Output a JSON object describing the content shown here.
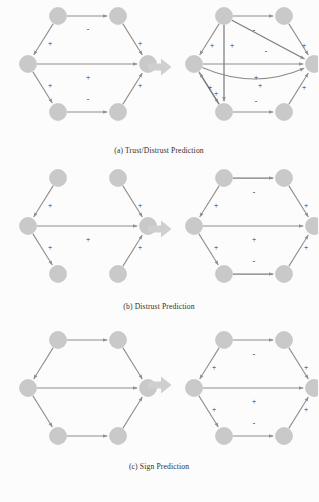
{
  "figure": {
    "background_color": "#fcfcfc",
    "node_color": "#c9c9c9",
    "edge_color": "#8d8d8d",
    "text_color": "#2b2b2b",
    "transition_arrow_color": "#cfcfcf"
  },
  "panels": [
    {
      "id": "a",
      "caption": "(a)  Trust/Distrust Prediction",
      "transition_icon": "right-block-arrow",
      "input_graph": {
        "nodes": [
          {
            "id": "n1",
            "label": "",
            "x": 44,
            "y": 16
          },
          {
            "id": "n2",
            "label": "",
            "x": 104,
            "y": 16
          },
          {
            "id": "n3",
            "label": "",
            "x": 14,
            "y": 64
          },
          {
            "id": "n4",
            "label": "",
            "x": 134,
            "y": 64
          },
          {
            "id": "n5",
            "label": "",
            "x": 44,
            "y": 112
          },
          {
            "id": "n6",
            "label": "",
            "x": 104,
            "y": 112
          }
        ],
        "edges": [
          {
            "from": "n1",
            "to": "n2",
            "sign": "-",
            "sign_x": 74,
            "sign_y": 30
          },
          {
            "from": "n1",
            "to": "n3",
            "sign": "+",
            "sign_x": 36,
            "sign_y": 44
          },
          {
            "from": "n3",
            "to": "n4",
            "sign": "+",
            "sign_x": 74,
            "sign_y": 78
          },
          {
            "from": "n3",
            "to": "n5",
            "sign": "+",
            "sign_x": 36,
            "sign_y": 86
          },
          {
            "from": "n5",
            "to": "n6",
            "sign": "-",
            "sign_x": 74,
            "sign_y": 100
          },
          {
            "from": "n6",
            "to": "n4",
            "sign": "+",
            "sign_x": 126,
            "sign_y": 86
          },
          {
            "from": "n2",
            "to": "n4",
            "sign": "+",
            "sign_x": 126,
            "sign_y": 44
          }
        ]
      },
      "output_graph": {
        "nodes": [
          {
            "id": "n1",
            "label": "",
            "x": 44,
            "y": 16
          },
          {
            "id": "n2",
            "label": "",
            "x": 104,
            "y": 16
          },
          {
            "id": "n3",
            "label": "",
            "x": 14,
            "y": 64
          },
          {
            "id": "n4",
            "label": "",
            "x": 134,
            "y": 64
          },
          {
            "id": "n5",
            "label": "",
            "x": 44,
            "y": 112
          },
          {
            "id": "n6",
            "label": "",
            "x": 104,
            "y": 112
          }
        ],
        "edges": [
          {
            "from": "n1",
            "to": "n2",
            "sign": "-",
            "sign_x": 74,
            "sign_y": 31
          },
          {
            "from": "n1",
            "to": "n3",
            "sign": "+",
            "sign_x": 32,
            "sign_y": 46
          },
          {
            "from": "n3",
            "to": "n4",
            "sign": "+",
            "sign_x": 76,
            "sign_y": 78
          },
          {
            "from": "n3",
            "to": "n5",
            "sign": "+",
            "sign_x": 30,
            "sign_y": 88
          },
          {
            "from": "n5",
            "to": "n6",
            "sign": "-",
            "sign_x": 76,
            "sign_y": 102
          },
          {
            "from": "n6",
            "to": "n4",
            "sign": "+",
            "sign_x": 124,
            "sign_y": 88
          },
          {
            "from": "n2",
            "to": "n4",
            "sign": "+",
            "sign_x": 124,
            "sign_y": 46
          }
        ],
        "predicted_edges": [
          {
            "from": "n1",
            "to": "n4",
            "sign": "-",
            "sign_x": 86,
            "sign_y": 52,
            "kind": "diagonal"
          },
          {
            "from": "n1",
            "to": "n5",
            "sign": "+",
            "sign_x": 52,
            "sign_y": 46,
            "kind": "vertical"
          },
          {
            "from": "n3",
            "to": "n4",
            "sign": "+",
            "sign_x": 80,
            "sign_y": 86,
            "kind": "curve"
          },
          {
            "from": "n5",
            "to": "n3",
            "sign": "+",
            "sign_x": 36,
            "sign_y": 94,
            "kind": "diagonal-up"
          }
        ]
      }
    },
    {
      "id": "b",
      "caption": "(b)  Distrust Prediction",
      "transition_icon": "right-block-arrow",
      "input_graph": {
        "nodes": [
          {
            "id": "n1",
            "label": "",
            "x": 44,
            "y": 16
          },
          {
            "id": "n2",
            "label": "",
            "x": 104,
            "y": 16
          },
          {
            "id": "n3",
            "label": "",
            "x": 14,
            "y": 64
          },
          {
            "id": "n4",
            "label": "",
            "x": 134,
            "y": 64
          },
          {
            "id": "n5",
            "label": "",
            "x": 44,
            "y": 112
          },
          {
            "id": "n6",
            "label": "",
            "x": 104,
            "y": 112
          }
        ],
        "edges": [
          {
            "from": "n1",
            "to": "n3",
            "sign": "+",
            "sign_x": 36,
            "sign_y": 44
          },
          {
            "from": "n3",
            "to": "n4",
            "sign": "+",
            "sign_x": 74,
            "sign_y": 78
          },
          {
            "from": "n3",
            "to": "n5",
            "sign": "+",
            "sign_x": 36,
            "sign_y": 86
          },
          {
            "from": "n6",
            "to": "n4",
            "sign": "+",
            "sign_x": 126,
            "sign_y": 86
          },
          {
            "from": "n2",
            "to": "n4",
            "sign": "+",
            "sign_x": 126,
            "sign_y": 44
          }
        ]
      },
      "output_graph": {
        "nodes": [
          {
            "id": "n1",
            "label": "",
            "x": 44,
            "y": 16
          },
          {
            "id": "n2",
            "label": "",
            "x": 104,
            "y": 16
          },
          {
            "id": "n3",
            "label": "",
            "x": 14,
            "y": 64
          },
          {
            "id": "n4",
            "label": "",
            "x": 134,
            "y": 64
          },
          {
            "id": "n5",
            "label": "",
            "x": 44,
            "y": 112
          },
          {
            "id": "n6",
            "label": "",
            "x": 104,
            "y": 112
          }
        ],
        "edges": [
          {
            "from": "n1",
            "to": "n3",
            "sign": "+",
            "sign_x": 36,
            "sign_y": 44
          },
          {
            "from": "n3",
            "to": "n4",
            "sign": "+",
            "sign_x": 74,
            "sign_y": 78
          },
          {
            "from": "n3",
            "to": "n5",
            "sign": "+",
            "sign_x": 36,
            "sign_y": 86
          },
          {
            "from": "n6",
            "to": "n4",
            "sign": "+",
            "sign_x": 126,
            "sign_y": 86
          },
          {
            "from": "n2",
            "to": "n4",
            "sign": "+",
            "sign_x": 126,
            "sign_y": 44
          }
        ],
        "predicted_edges": [
          {
            "from": "n1",
            "to": "n2",
            "sign": "-",
            "sign_x": 74,
            "sign_y": 31,
            "kind": "top"
          },
          {
            "from": "n5",
            "to": "n6",
            "sign": "-",
            "sign_x": 74,
            "sign_y": 100,
            "kind": "bottom"
          }
        ]
      }
    },
    {
      "id": "c",
      "caption": "(c)  Sign Prediction",
      "transition_icon": "right-block-arrow",
      "input_graph": {
        "nodes": [
          {
            "id": "n1",
            "label": "",
            "x": 44,
            "y": 16
          },
          {
            "id": "n2",
            "label": "",
            "x": 104,
            "y": 16
          },
          {
            "id": "n3",
            "label": "",
            "x": 14,
            "y": 64
          },
          {
            "id": "n4",
            "label": "",
            "x": 134,
            "y": 64
          },
          {
            "id": "n5",
            "label": "",
            "x": 44,
            "y": 112
          },
          {
            "id": "n6",
            "label": "",
            "x": 104,
            "y": 112
          }
        ],
        "edges": [
          {
            "from": "n1",
            "to": "n2",
            "sign": "",
            "sign_x": 74,
            "sign_y": 31
          },
          {
            "from": "n1",
            "to": "n3",
            "sign": "",
            "sign_x": 36,
            "sign_y": 44
          },
          {
            "from": "n3",
            "to": "n4",
            "sign": "",
            "sign_x": 74,
            "sign_y": 78
          },
          {
            "from": "n3",
            "to": "n5",
            "sign": "",
            "sign_x": 36,
            "sign_y": 86
          },
          {
            "from": "n5",
            "to": "n6",
            "sign": "",
            "sign_x": 74,
            "sign_y": 100
          },
          {
            "from": "n6",
            "to": "n4",
            "sign": "",
            "sign_x": 126,
            "sign_y": 86
          },
          {
            "from": "n2",
            "to": "n4",
            "sign": "",
            "sign_x": 126,
            "sign_y": 44
          }
        ]
      },
      "output_graph": {
        "nodes": [
          {
            "id": "n1",
            "label": "",
            "x": 44,
            "y": 16
          },
          {
            "id": "n2",
            "label": "",
            "x": 104,
            "y": 16
          },
          {
            "id": "n3",
            "label": "",
            "x": 14,
            "y": 64
          },
          {
            "id": "n4",
            "label": "",
            "x": 134,
            "y": 64
          },
          {
            "id": "n5",
            "label": "",
            "x": 44,
            "y": 112
          },
          {
            "id": "n6",
            "label": "",
            "x": 104,
            "y": 112
          }
        ],
        "edges": [
          {
            "from": "n1",
            "to": "n2",
            "sign": "-",
            "sign_x": 74,
            "sign_y": 31
          },
          {
            "from": "n1",
            "to": "n3",
            "sign": "+",
            "sign_x": 34,
            "sign_y": 44
          },
          {
            "from": "n3",
            "to": "n4",
            "sign": "+",
            "sign_x": 74,
            "sign_y": 78
          },
          {
            "from": "n3",
            "to": "n5",
            "sign": "+",
            "sign_x": 34,
            "sign_y": 86
          },
          {
            "from": "n5",
            "to": "n6",
            "sign": "-",
            "sign_x": 74,
            "sign_y": 100
          },
          {
            "from": "n6",
            "to": "n4",
            "sign": "+",
            "sign_x": 126,
            "sign_y": 86
          },
          {
            "from": "n2",
            "to": "n4",
            "sign": "+",
            "sign_x": 126,
            "sign_y": 44
          }
        ]
      }
    }
  ]
}
